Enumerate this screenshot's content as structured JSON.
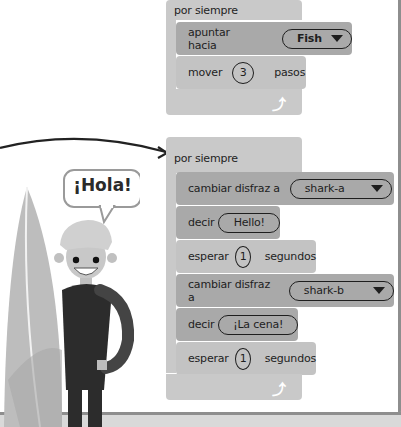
{
  "scripts": [
    {
      "name": "script-fish-chase",
      "hat": "por siempre",
      "blocks": [
        {
          "type": "motion",
          "label": "apuntar hacia",
          "dropdown": "Fish"
        },
        {
          "type": "motion",
          "label": "mover",
          "value": "3",
          "suffix": "pasos"
        }
      ],
      "loop_icon": "loop-arrow-icon"
    },
    {
      "name": "script-shark-costume",
      "hat": "por siempre",
      "blocks": [
        {
          "type": "looks",
          "label": "cambiar disfraz a",
          "dropdown": "shark-a"
        },
        {
          "type": "looks",
          "label": "decir",
          "value": "Hello!"
        },
        {
          "type": "control",
          "label": "esperar",
          "value": "1",
          "suffix": "segundos"
        },
        {
          "type": "looks",
          "label": "cambiar disfraz a",
          "dropdown": "shark-b"
        },
        {
          "type": "looks",
          "label": "decir",
          "value": "¡La cena!"
        },
        {
          "type": "control",
          "label": "esperar",
          "value": "1",
          "suffix": "segundos"
        }
      ],
      "loop_icon": "loop-arrow-icon"
    }
  ],
  "illustration": {
    "speech_bubble": "¡Hola!"
  },
  "colors": {
    "hat_block": "#c9c9c9",
    "dark_block": "#a9a9a9",
    "light_block": "#c3c3c3",
    "frame": "#8e8e8e",
    "ground": "#d9d9d9"
  }
}
